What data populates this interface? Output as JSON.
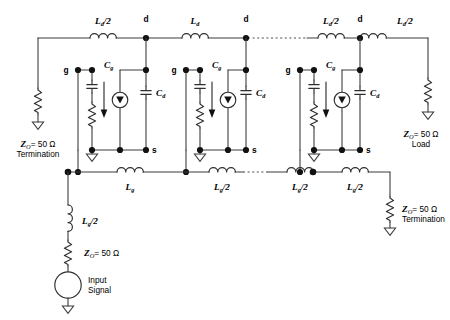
{
  "figure": {
    "type": "circuit-diagram",
    "width": 450,
    "height": 320,
    "background_color": "#ffffff",
    "line_color": "#3c3c3c"
  },
  "labels": {
    "drain_line_half_left": "L",
    "drain_line_half_left_sub": "d",
    "drain_line_half_left_suffix": "/2",
    "drain_line_full": "L",
    "drain_line_full_sub": "d",
    "drain_line_half_right": "L",
    "gate_line_full": "L",
    "gate_line_full_sub": "g",
    "gate_line_half": "L",
    "gate_line_half_suffix": "/2",
    "cap_gate": "C",
    "cap_gate_sub": "g",
    "cap_drain": "C",
    "cap_drain_sub": "d",
    "node_gate": "g",
    "node_drain": "d",
    "node_source": "s",
    "impedance_symbol": "Z",
    "impedance_sub": "O",
    "impedance_value": "= 50 Ω",
    "termination": "Termination",
    "load": "Load",
    "input_signal_line1": "Input",
    "input_signal_line2": "Signal"
  },
  "inductors": [
    {
      "id": "ld-half-left",
      "label": "L_d/2",
      "x": 103,
      "y": 38,
      "rail": "drain"
    },
    {
      "id": "ld-full-1",
      "label": "L_d",
      "x": 195,
      "y": 38,
      "rail": "drain"
    },
    {
      "id": "ld-half-right-1",
      "label": "L_d/2",
      "x": 330,
      "y": 38,
      "rail": "drain"
    },
    {
      "id": "ld-half-right-2",
      "label": "L_d/2",
      "x": 405,
      "y": 38,
      "rail": "drain"
    },
    {
      "id": "lg-full-1",
      "label": "L_g",
      "x": 130,
      "y": 172,
      "rail": "gate"
    },
    {
      "id": "lg-half-1",
      "label": "L_g/2",
      "x": 222,
      "y": 172,
      "rail": "gate"
    },
    {
      "id": "lg-half-2",
      "label": "L_g/2",
      "x": 300,
      "y": 172,
      "rail": "gate"
    },
    {
      "id": "lg-half-3",
      "label": "L_g/2",
      "x": 355,
      "y": 172,
      "rail": "gate"
    },
    {
      "id": "lg-half-input",
      "label": "L_g/2",
      "x": 68,
      "y": 222,
      "rail": "input"
    }
  ],
  "terminations": [
    {
      "id": "gate-line-termination-left",
      "impedance": "Z_O = 50 Ω",
      "caption": "Termination",
      "x": 38
    },
    {
      "id": "drain-line-load-right",
      "impedance": "Z_O = 50 Ω",
      "caption": "Load",
      "x": 428
    },
    {
      "id": "gate-line-termination-right",
      "impedance": "Z_O = 50 Ω",
      "caption": "Termination",
      "x": 390
    },
    {
      "id": "input-source-impedance",
      "impedance": "Z_O = 50 Ω",
      "caption": "",
      "x": 68
    }
  ],
  "cells": [
    {
      "id": "fet-cell-1",
      "gate_x": 78,
      "source_x": 102,
      "drain_x": 146,
      "label_gate": "g",
      "label_drain": "d",
      "label_source": "s"
    },
    {
      "id": "fet-cell-2",
      "gate_x": 186,
      "source_x": 210,
      "drain_x": 246,
      "label_gate": "g",
      "label_drain": "d",
      "label_source": "s"
    },
    {
      "id": "fet-cell-3",
      "gate_x": 300,
      "source_x": 324,
      "drain_x": 360,
      "label_gate": "g",
      "label_drain": "d",
      "label_source": "s"
    }
  ],
  "source": {
    "id": "input-signal-source",
    "caption_line1": "Input",
    "caption_line2": "Signal",
    "x": 68,
    "y": 272
  },
  "rails": {
    "drain_y": 38,
    "gate_top_y": 70,
    "source_y": 150,
    "gate_bottom_y": 172
  },
  "dotted_segments": [
    {
      "id": "drain-rail-ellipsis",
      "x1": 248,
      "x2": 307,
      "y": 38
    },
    {
      "id": "gate-rail-ellipsis",
      "x1": 243,
      "x2": 268,
      "y": 172
    }
  ]
}
